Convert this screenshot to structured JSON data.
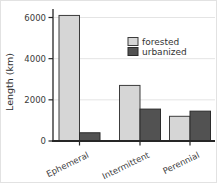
{
  "figure": {
    "background": "#ffffff",
    "border_color": "#e2e2e2"
  },
  "chart_data": {
    "type": "bar",
    "title": "",
    "xlabel": "",
    "ylabel": "Length (km)",
    "categories": [
      "Ephemeral",
      "Intermittent",
      "Perennial"
    ],
    "series": [
      {
        "name": "forested",
        "color": "#d6d6d6",
        "edge_color": "#3c3c3c",
        "values": [
          6100,
          2700,
          1200
        ]
      },
      {
        "name": "urbanized",
        "color": "#525252",
        "edge_color": "#2b2b2b",
        "values": [
          400,
          1550,
          1450
        ]
      }
    ],
    "ylim": [
      0,
      6400
    ],
    "yticks": [
      0,
      2000,
      4000,
      6000
    ],
    "grid": "horizontal",
    "gridline_color": "#e4e4e4",
    "axis_color": "#262626",
    "tick_label_color": "#3a3a3a",
    "legend": {
      "position": "upper-right",
      "entries": [
        "forested",
        "urbanized"
      ]
    }
  }
}
